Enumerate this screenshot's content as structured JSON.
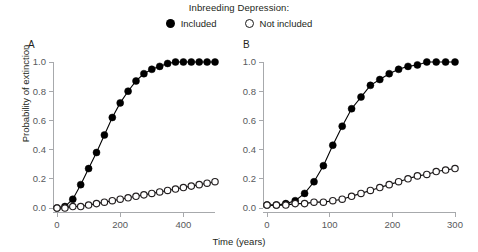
{
  "legend": {
    "title": "Inbreeding Depression:",
    "entries": [
      {
        "label": "Included",
        "marker": "filled-circle-icon",
        "color": "#000000"
      },
      {
        "label": "Not included",
        "marker": "open-circle-icon",
        "color": "#ffffff"
      }
    ]
  },
  "axes": {
    "ylabel": "Probability of extinction",
    "xlabel": "Time (years)"
  },
  "panels": [
    {
      "id": "A",
      "label": "A"
    },
    {
      "id": "B",
      "label": "B"
    }
  ],
  "chart_data": [
    {
      "type": "line",
      "panel": "A",
      "title": "",
      "xlabel": "Time (years)",
      "ylabel": "Probability of extinction",
      "xlim": [
        0,
        500
      ],
      "ylim": [
        0.0,
        1.0
      ],
      "xticks": [
        0,
        200,
        400
      ],
      "yticks": [
        0.0,
        0.2,
        0.4,
        0.6,
        0.8,
        1.0
      ],
      "grid": false,
      "legend_position": "top-center",
      "x": [
        0,
        25,
        50,
        75,
        100,
        125,
        150,
        175,
        200,
        225,
        250,
        275,
        300,
        325,
        350,
        375,
        400,
        425,
        450,
        475,
        500
      ],
      "series": [
        {
          "name": "Included",
          "marker": "filled-circle",
          "values": [
            0.0,
            0.01,
            0.06,
            0.16,
            0.27,
            0.38,
            0.5,
            0.62,
            0.72,
            0.8,
            0.87,
            0.92,
            0.95,
            0.97,
            0.99,
            1.0,
            1.0,
            1.0,
            1.0,
            1.0,
            1.0
          ]
        },
        {
          "name": "Not included",
          "marker": "open-circle",
          "values": [
            0.0,
            0.0,
            0.01,
            0.01,
            0.02,
            0.03,
            0.04,
            0.05,
            0.06,
            0.07,
            0.08,
            0.09,
            0.1,
            0.11,
            0.12,
            0.13,
            0.14,
            0.15,
            0.16,
            0.17,
            0.18
          ]
        }
      ]
    },
    {
      "type": "line",
      "panel": "B",
      "title": "",
      "xlabel": "Time (years)",
      "ylabel": "Probability of extinction",
      "xlim": [
        0,
        300
      ],
      "ylim": [
        0.0,
        1.0
      ],
      "xticks": [
        0,
        100,
        200,
        300
      ],
      "yticks": [
        0.0,
        0.2,
        0.4,
        0.6,
        0.8,
        1.0
      ],
      "grid": false,
      "legend_position": "top-center",
      "x": [
        0,
        15,
        30,
        45,
        60,
        75,
        90,
        105,
        120,
        135,
        150,
        165,
        180,
        195,
        210,
        225,
        240,
        255,
        270,
        285,
        300
      ],
      "series": [
        {
          "name": "Included",
          "marker": "filled-circle",
          "values": [
            0.02,
            0.02,
            0.03,
            0.05,
            0.1,
            0.18,
            0.29,
            0.43,
            0.56,
            0.68,
            0.76,
            0.84,
            0.88,
            0.92,
            0.95,
            0.97,
            0.98,
            1.0,
            1.0,
            1.0,
            1.0
          ]
        },
        {
          "name": "Not included",
          "marker": "open-circle",
          "values": [
            0.02,
            0.02,
            0.02,
            0.03,
            0.03,
            0.04,
            0.04,
            0.05,
            0.06,
            0.08,
            0.1,
            0.12,
            0.14,
            0.16,
            0.18,
            0.2,
            0.22,
            0.23,
            0.25,
            0.26,
            0.27
          ]
        }
      ]
    }
  ]
}
